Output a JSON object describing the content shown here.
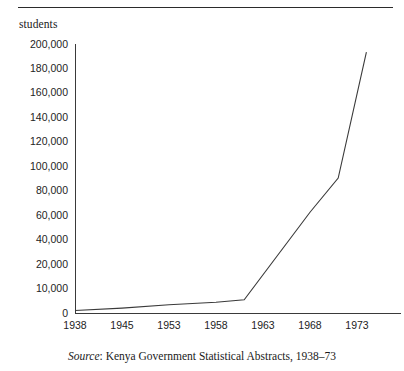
{
  "figure": {
    "y_axis_title": "students",
    "caption_prefix": "Source",
    "caption_text": ": Kenya Government Statistical Abstracts, 1938–73"
  },
  "chart_data": {
    "type": "line",
    "title": "",
    "subtitle": "",
    "xlabel": "",
    "ylabel": "students",
    "grid": false,
    "legend": "none",
    "x_tick_labels": [
      "1938",
      "1945",
      "1953",
      "1958",
      "1963",
      "1968",
      "1973"
    ],
    "y_tick_labels": [
      "0",
      "10,000",
      "20,000",
      "40,000",
      "60,000",
      "80,000",
      "100,000",
      "120,000",
      "140,000",
      "160,000",
      "180,000",
      "200,000"
    ],
    "y_tick_values": [
      0,
      10000,
      20000,
      40000,
      60000,
      80000,
      100000,
      120000,
      140000,
      160000,
      180000,
      200000
    ],
    "y_axis_note": "non-linear axis: evenly spaced ticks at 0, 10,000, 20,000 then 20,000 increments to 200,000",
    "x_axis_note": "evenly spaced year ticks despite uneven year intervals",
    "ylim": [
      0,
      200000
    ],
    "series": [
      {
        "name": "students",
        "x": [
          "1938",
          "1945",
          "1953",
          "1958",
          "1961",
          "1968",
          "1971",
          "1974"
        ],
        "values": [
          800,
          1800,
          3200,
          4200,
          5200,
          62000,
          90000,
          193000
        ]
      }
    ],
    "annotations": []
  },
  "colors": {
    "line": "#3a3a3a",
    "axis": "#3a3a3a",
    "text": "#1a1a1a",
    "background": "#ffffff"
  }
}
